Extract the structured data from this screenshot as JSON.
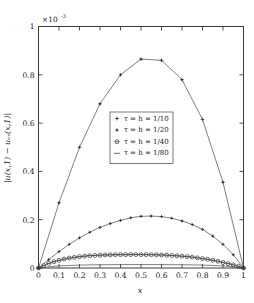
{
  "figure": {
    "exponent_prefix": "×10",
    "exponent_value": "-3",
    "xlabel": "x",
    "ylabel": "|u(x,1) − uₑₓ(x,1)|"
  },
  "axes": {
    "x_ticks": [
      "0",
      "0.1",
      "0.2",
      "0.3",
      "0.4",
      "0.5",
      "0.6",
      "0.7",
      "0.8",
      "0.9",
      "1"
    ],
    "y_ticks": [
      "0",
      "0.2",
      "0.4",
      "0.6",
      "0.8",
      "1"
    ]
  },
  "legend": {
    "entries": [
      {
        "label": "τ = h = 1/10",
        "marker": "plus-marker"
      },
      {
        "label": "τ = h = 1/20",
        "marker": "plus-marker"
      },
      {
        "label": "τ = h = 1/40",
        "marker": "circle-plus-marker"
      },
      {
        "label": "τ = h = 1/80",
        "marker": "line-marker"
      }
    ]
  },
  "chart_data": {
    "type": "line",
    "title": "",
    "xlabel": "x",
    "ylabel": "|u(x,1) - u_ex(x,1)|",
    "y_scale_factor": "1e-3",
    "xlim": [
      0,
      1
    ],
    "ylim": [
      0,
      1
    ],
    "grid": false,
    "legend_position": "center",
    "series": [
      {
        "name": "τ = h = 1/10",
        "marker": "plus",
        "x": [
          0,
          0.1,
          0.2,
          0.3,
          0.4,
          0.5,
          0.6,
          0.7,
          0.8,
          0.9,
          1.0
        ],
        "values": [
          0.0,
          0.27,
          0.5,
          0.68,
          0.8,
          0.865,
          0.86,
          0.78,
          0.615,
          0.355,
          0.0
        ]
      },
      {
        "name": "τ = h = 1/20",
        "marker": "plus",
        "x": [
          0,
          0.05,
          0.1,
          0.15,
          0.2,
          0.25,
          0.3,
          0.35,
          0.4,
          0.45,
          0.5,
          0.55,
          0.6,
          0.65,
          0.7,
          0.75,
          0.8,
          0.85,
          0.9,
          0.95,
          1.0
        ],
        "values": [
          0.0,
          0.035,
          0.068,
          0.098,
          0.125,
          0.148,
          0.168,
          0.184,
          0.197,
          0.208,
          0.214,
          0.215,
          0.213,
          0.206,
          0.195,
          0.18,
          0.16,
          0.132,
          0.098,
          0.055,
          0.0
        ]
      },
      {
        "name": "τ = h = 1/40",
        "marker": "circle",
        "x": [
          0,
          0.025,
          0.05,
          0.075,
          0.1,
          0.125,
          0.15,
          0.175,
          0.2,
          0.225,
          0.25,
          0.275,
          0.3,
          0.325,
          0.35,
          0.375,
          0.4,
          0.425,
          0.45,
          0.475,
          0.5,
          0.525,
          0.55,
          0.575,
          0.6,
          0.625,
          0.65,
          0.675,
          0.7,
          0.725,
          0.75,
          0.775,
          0.8,
          0.825,
          0.85,
          0.875,
          0.9,
          0.925,
          0.95,
          0.975,
          1.0
        ],
        "values": [
          0.0,
          0.01,
          0.019,
          0.026,
          0.032,
          0.037,
          0.041,
          0.044,
          0.047,
          0.049,
          0.051,
          0.052,
          0.053,
          0.054,
          0.0545,
          0.055,
          0.0553,
          0.0555,
          0.0556,
          0.0556,
          0.0555,
          0.0553,
          0.055,
          0.0545,
          0.054,
          0.053,
          0.052,
          0.0505,
          0.049,
          0.047,
          0.045,
          0.042,
          0.039,
          0.036,
          0.032,
          0.028,
          0.023,
          0.018,
          0.013,
          0.007,
          0.0
        ]
      },
      {
        "name": "τ = h = 1/80",
        "marker": "none",
        "x": [
          0,
          0.1,
          0.2,
          0.3,
          0.4,
          0.5,
          0.6,
          0.7,
          0.8,
          0.9,
          1.0
        ],
        "values": [
          0.0,
          0.009,
          0.012,
          0.0135,
          0.014,
          0.0142,
          0.014,
          0.0135,
          0.012,
          0.009,
          0.0
        ]
      }
    ]
  }
}
